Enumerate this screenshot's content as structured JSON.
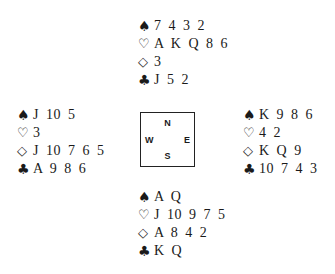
{
  "suits": {
    "spades": "♠",
    "hearts": "♡",
    "diamonds": "◇",
    "clubs": "♣"
  },
  "hands": {
    "north": {
      "spades": "7 4 3 2",
      "hearts": "A K Q 8 6",
      "diamonds": "3",
      "clubs": "J 5 2"
    },
    "west": {
      "spades": "J 10 5",
      "hearts": "3",
      "diamonds": "J 10 7 6 5",
      "clubs": "A 9 8 6"
    },
    "east": {
      "spades": "K 9 8 6",
      "hearts": "4 2",
      "diamonds": "K Q 9",
      "clubs": "10 7 4 3"
    },
    "south": {
      "spades": "A Q",
      "hearts": "J 10 9 7 5",
      "diamonds": "A 8 4 2",
      "clubs": "K Q"
    }
  },
  "compass": {
    "north": "N",
    "south": "S",
    "west": "W",
    "east": "E"
  },
  "colors": {
    "text": "#1a1a1a",
    "background": "#ffffff"
  }
}
